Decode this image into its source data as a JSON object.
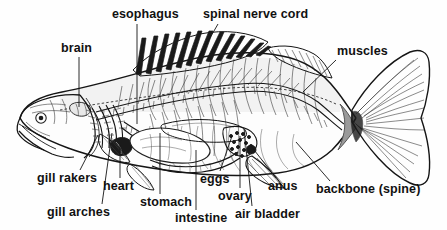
{
  "diagram": {
    "style": "black and white pen-and-ink line drawing",
    "background_color": "#ffffff",
    "ink_color": "#141414",
    "width": 447,
    "height": 230
  },
  "labels": [
    {
      "id": "brain",
      "text": "brain",
      "x": 61,
      "y": 42,
      "align": "left"
    },
    {
      "id": "esophagus",
      "text": "esophagus",
      "x": 112,
      "y": 8,
      "align": "left"
    },
    {
      "id": "spinal-nerve-cord",
      "text": "spinal nerve cord",
      "x": 203,
      "y": 8,
      "align": "left"
    },
    {
      "id": "muscles",
      "text": "muscles",
      "x": 337,
      "y": 45,
      "align": "left"
    },
    {
      "id": "gill-rakers",
      "text": "gill rakers",
      "x": 37,
      "y": 172,
      "align": "left"
    },
    {
      "id": "gill-arches",
      "text": "gill arches",
      "x": 47,
      "y": 206,
      "align": "left"
    },
    {
      "id": "heart",
      "text": "heart",
      "x": 103,
      "y": 180,
      "align": "left"
    },
    {
      "id": "stomach",
      "text": "stomach",
      "x": 140,
      "y": 196,
      "align": "left"
    },
    {
      "id": "intestine",
      "text": "intestine",
      "x": 175,
      "y": 212,
      "align": "left"
    },
    {
      "id": "eggs",
      "text": "eggs",
      "x": 200,
      "y": 173,
      "align": "left"
    },
    {
      "id": "ovary",
      "text": "ovary",
      "x": 218,
      "y": 190,
      "align": "left"
    },
    {
      "id": "air-bladder",
      "text": "air bladder",
      "x": 235,
      "y": 208,
      "align": "left"
    },
    {
      "id": "anus",
      "text": "anus",
      "x": 268,
      "y": 180,
      "align": "left"
    },
    {
      "id": "backbone",
      "text": "backbone (spine)",
      "x": 316,
      "y": 183,
      "align": "left"
    }
  ],
  "leader_lines": [
    {
      "id": "brain-leader",
      "from": [
        79,
        57
      ],
      "to": [
        79,
        107
      ]
    },
    {
      "id": "esophagus-leader",
      "from": [
        137,
        24
      ],
      "to": [
        137,
        124
      ]
    },
    {
      "id": "spinal-leader",
      "from": [
        218,
        24
      ],
      "to": [
        196,
        62
      ]
    },
    {
      "id": "muscles-leader",
      "from": [
        336,
        60
      ],
      "to": [
        303,
        92
      ]
    },
    {
      "id": "gill-rakers-leader",
      "from": [
        80,
        170
      ],
      "to": [
        98,
        135
      ]
    },
    {
      "id": "gill-arches-leader",
      "from": [
        102,
        204
      ],
      "to": [
        112,
        133
      ]
    },
    {
      "id": "heart-leader",
      "from": [
        120,
        178
      ],
      "to": [
        120,
        145
      ]
    },
    {
      "id": "stomach-leader",
      "from": [
        160,
        194
      ],
      "to": [
        160,
        133
      ]
    },
    {
      "id": "intestine-leader",
      "from": [
        196,
        210
      ],
      "to": [
        196,
        150
      ]
    },
    {
      "id": "eggs-leader",
      "from": [
        220,
        171
      ],
      "to": [
        232,
        136
      ]
    },
    {
      "id": "ovary-leader",
      "from": [
        240,
        188
      ],
      "to": [
        240,
        136
      ]
    },
    {
      "id": "air-bladder-leader",
      "from": [
        252,
        206
      ],
      "to": [
        244,
        128
      ]
    },
    {
      "id": "anus-leader",
      "from": [
        276,
        178
      ],
      "to": [
        251,
        146
      ]
    },
    {
      "id": "backbone-leader",
      "from": [
        330,
        181
      ],
      "to": [
        296,
        142
      ]
    }
  ],
  "anatomy_parts": [
    "body outline",
    "head",
    "eye",
    "jaw",
    "operculum",
    "spiny dorsal fin",
    "soft dorsal fin",
    "caudal fin",
    "pectoral fin",
    "pelvic fin",
    "anal fin",
    "gill arches",
    "gill rakers",
    "brain",
    "spinal nerve cord",
    "esophagus",
    "heart",
    "stomach",
    "intestine",
    "ovary",
    "eggs",
    "air bladder",
    "anus",
    "backbone",
    "ribs",
    "muscle segments"
  ]
}
